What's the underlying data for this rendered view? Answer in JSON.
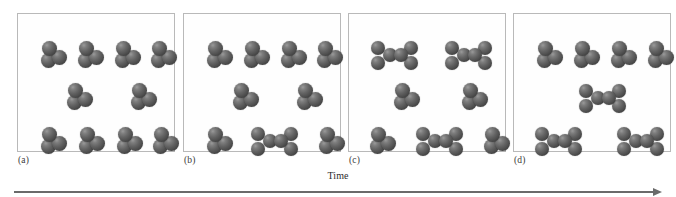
{
  "figure": {
    "axis_label": "Time",
    "axis_icon": "right-arrow-icon",
    "panel_count": 4,
    "colors": {
      "atom_dark": "#3a3a3a",
      "atom_mid": "#636363",
      "atom_light": "#9a9a9a",
      "panel_border": "#b9b9b9",
      "axis": "#6a6a6a",
      "background": "#ffffff"
    }
  },
  "chart_data": {
    "type": "diagram",
    "title": "",
    "xlabel": "Time",
    "ylabel": "",
    "categories": [
      "(a)",
      "(b)",
      "(c)",
      "(d)"
    ],
    "series": [
      {
        "name": "monomers",
        "values": [
          10,
          8,
          4,
          4
        ]
      },
      {
        "name": "dimers",
        "values": [
          0,
          1,
          3,
          3
        ]
      }
    ],
    "panels": [
      {
        "label": "(a)",
        "monomer_count": 10,
        "dimer_count": 0,
        "molecules": [
          {
            "type": "monomer",
            "x": 36,
            "y": 40
          },
          {
            "type": "monomer",
            "x": 73,
            "y": 40
          },
          {
            "type": "monomer",
            "x": 110,
            "y": 40
          },
          {
            "type": "monomer",
            "x": 146,
            "y": 40
          },
          {
            "type": "monomer",
            "x": 62,
            "y": 82
          },
          {
            "type": "monomer",
            "x": 126,
            "y": 82
          },
          {
            "type": "monomer",
            "x": 36,
            "y": 126
          },
          {
            "type": "monomer",
            "x": 74,
            "y": 126
          },
          {
            "type": "monomer",
            "x": 112,
            "y": 126
          },
          {
            "type": "monomer",
            "x": 148,
            "y": 126
          }
        ]
      },
      {
        "label": "(b)",
        "monomer_count": 8,
        "dimer_count": 1,
        "molecules": [
          {
            "type": "monomer",
            "x": 36,
            "y": 40
          },
          {
            "type": "monomer",
            "x": 73,
            "y": 40
          },
          {
            "type": "monomer",
            "x": 110,
            "y": 40
          },
          {
            "type": "monomer",
            "x": 146,
            "y": 40
          },
          {
            "type": "monomer",
            "x": 62,
            "y": 82
          },
          {
            "type": "monomer",
            "x": 126,
            "y": 82
          },
          {
            "type": "monomer",
            "x": 36,
            "y": 126
          },
          {
            "type": "dimer",
            "x": 92,
            "y": 128
          },
          {
            "type": "monomer",
            "x": 148,
            "y": 126
          }
        ]
      },
      {
        "label": "(c)",
        "monomer_count": 4,
        "dimer_count": 3,
        "molecules": [
          {
            "type": "dimer",
            "x": 47,
            "y": 42
          },
          {
            "type": "dimer",
            "x": 121,
            "y": 42
          },
          {
            "type": "monomer",
            "x": 58,
            "y": 82
          },
          {
            "type": "monomer",
            "x": 126,
            "y": 82
          },
          {
            "type": "monomer",
            "x": 34,
            "y": 126
          },
          {
            "type": "dimer",
            "x": 92,
            "y": 128
          },
          {
            "type": "monomer",
            "x": 148,
            "y": 126
          }
        ]
      },
      {
        "label": "(d)",
        "monomer_count": 4,
        "dimer_count": 3,
        "molecules": [
          {
            "type": "monomer",
            "x": 36,
            "y": 40
          },
          {
            "type": "monomer",
            "x": 73,
            "y": 40
          },
          {
            "type": "monomer",
            "x": 110,
            "y": 40
          },
          {
            "type": "monomer",
            "x": 147,
            "y": 40
          },
          {
            "type": "dimer",
            "x": 90,
            "y": 85
          },
          {
            "type": "dimer",
            "x": 46,
            "y": 128
          },
          {
            "type": "dimer",
            "x": 128,
            "y": 128
          }
        ]
      }
    ]
  }
}
